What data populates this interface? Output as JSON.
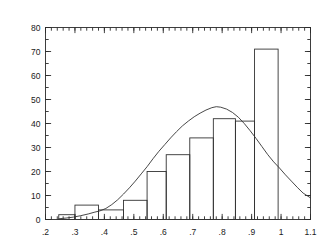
{
  "chart_data": {
    "type": "bar",
    "title": "",
    "subtitle": "",
    "xlabel": "",
    "ylabel": "",
    "xlim": [
      0.2,
      1.1
    ],
    "ylim": [
      0,
      80
    ],
    "grid": false,
    "legend": null,
    "xticks": [
      0.2,
      0.3,
      0.4,
      0.5,
      0.6,
      0.7,
      0.8,
      0.9,
      1.0,
      1.1
    ],
    "xtick_labels": [
      ".2",
      ".3",
      ".4",
      ".5",
      ".6",
      ".7",
      ".8",
      ".9",
      "1",
      "1.1"
    ],
    "x_minor_tick_step": 0.02,
    "yticks": [
      0,
      10,
      20,
      30,
      40,
      50,
      60,
      70,
      80
    ],
    "ytick_labels": [
      "0",
      "10",
      "20",
      "30",
      "40",
      "50",
      "60",
      "70",
      "80"
    ],
    "y_minor_tick_step": 5,
    "axes_box": "full",
    "tick_direction": "in",
    "bar_edge_color": "#333333",
    "bar_fill_color": "none",
    "curve_color": "#333333",
    "series": [
      {
        "name": "histogram",
        "type": "bar",
        "bins": [
          {
            "x0": 0.245,
            "x1": 0.3,
            "value": 2
          },
          {
            "x0": 0.3,
            "x1": 0.38,
            "value": 6
          },
          {
            "x0": 0.38,
            "x1": 0.465,
            "value": 4
          },
          {
            "x0": 0.465,
            "x1": 0.545,
            "value": 8
          },
          {
            "x0": 0.545,
            "x1": 0.61,
            "value": 20
          },
          {
            "x0": 0.61,
            "x1": 0.69,
            "value": 27
          },
          {
            "x0": 0.69,
            "x1": 0.77,
            "value": 34
          },
          {
            "x0": 0.77,
            "x1": 0.845,
            "value": 42
          },
          {
            "x0": 0.845,
            "x1": 0.91,
            "value": 41
          },
          {
            "x0": 0.91,
            "x1": 0.99,
            "value": 71
          }
        ]
      },
      {
        "name": "smoothed-density",
        "type": "line",
        "points": [
          [
            0.245,
            0.3
          ],
          [
            0.27,
            0.6
          ],
          [
            0.295,
            1.0
          ],
          [
            0.32,
            1.6
          ],
          [
            0.345,
            2.3
          ],
          [
            0.365,
            3.0
          ],
          [
            0.385,
            3.6
          ],
          [
            0.405,
            4.6
          ],
          [
            0.425,
            6.2
          ],
          [
            0.445,
            8.2
          ],
          [
            0.465,
            10.6
          ],
          [
            0.485,
            13.2
          ],
          [
            0.505,
            16.0
          ],
          [
            0.525,
            19.0
          ],
          [
            0.545,
            22.0
          ],
          [
            0.565,
            25.3
          ],
          [
            0.585,
            28.4
          ],
          [
            0.605,
            31.2
          ],
          [
            0.625,
            34.0
          ],
          [
            0.645,
            36.6
          ],
          [
            0.665,
            39.0
          ],
          [
            0.685,
            41.0
          ],
          [
            0.705,
            42.8
          ],
          [
            0.725,
            44.3
          ],
          [
            0.745,
            45.6
          ],
          [
            0.765,
            46.6
          ],
          [
            0.78,
            47.0
          ],
          [
            0.795,
            46.8
          ],
          [
            0.815,
            46.0
          ],
          [
            0.835,
            44.6
          ],
          [
            0.855,
            42.6
          ],
          [
            0.875,
            40.0
          ],
          [
            0.895,
            37.0
          ],
          [
            0.915,
            33.8
          ],
          [
            0.935,
            30.4
          ],
          [
            0.955,
            27.0
          ],
          [
            0.975,
            24.0
          ],
          [
            0.995,
            21.4
          ],
          [
            1.015,
            18.6
          ],
          [
            1.035,
            16.0
          ],
          [
            1.055,
            13.4
          ],
          [
            1.075,
            11.0
          ],
          [
            1.1,
            9.0
          ]
        ]
      }
    ]
  }
}
